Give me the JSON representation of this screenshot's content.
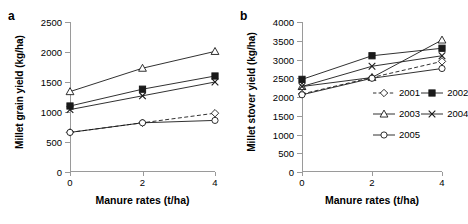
{
  "figure": {
    "panels": [
      {
        "letter": "a",
        "ylabel": "Millet grain yield (kg/ha)",
        "xlabel": "Manure rates (t/ha)"
      },
      {
        "letter": "b",
        "ylabel": "Millet stover yield (kg/ha)",
        "xlabel": "Manure rates (t/ha)"
      }
    ]
  },
  "legend": {
    "position": "inside-right-middle",
    "entries": [
      {
        "label": "2001",
        "marker": "diamond-open",
        "line": "dashed"
      },
      {
        "label": "2002",
        "marker": "square-filled",
        "line": "solid"
      },
      {
        "label": "2003",
        "marker": "triangle-open",
        "line": "solid"
      },
      {
        "label": "2004",
        "marker": "cross",
        "line": "solid"
      },
      {
        "label": "2005",
        "marker": "circle-open",
        "line": "solid"
      }
    ]
  },
  "chart_data": [
    {
      "type": "line",
      "panel": "a",
      "title": "",
      "xlabel": "Manure rates (t/ha)",
      "ylabel": "Millet grain yield (kg/ha)",
      "x": [
        0,
        2,
        4
      ],
      "xtick_labels": [
        "0",
        "2",
        "4"
      ],
      "xlim": [
        0,
        4
      ],
      "ylim": [
        0,
        2500
      ],
      "ytick_labels": [
        "0",
        "500",
        "1000",
        "1500",
        "2000",
        "2500"
      ],
      "yticks": [
        0,
        500,
        1000,
        1500,
        2000,
        2500
      ],
      "grid": false,
      "series": [
        {
          "name": "2001",
          "marker": "diamond-open",
          "line": "dashed",
          "values": [
            660,
            820,
            980
          ]
        },
        {
          "name": "2002",
          "marker": "square-filled",
          "line": "solid",
          "values": [
            1100,
            1380,
            1600
          ]
        },
        {
          "name": "2003",
          "marker": "triangle-open",
          "line": "solid",
          "values": [
            1340,
            1730,
            2010
          ]
        },
        {
          "name": "2004",
          "marker": "cross",
          "line": "solid",
          "values": [
            1040,
            1270,
            1500
          ]
        },
        {
          "name": "2005",
          "marker": "circle-open",
          "line": "solid",
          "values": [
            660,
            820,
            860
          ]
        }
      ]
    },
    {
      "type": "line",
      "panel": "b",
      "title": "",
      "xlabel": "Manure rates (t/ha)",
      "ylabel": "Millet stover yield (kg/ha)",
      "x": [
        0,
        2,
        4
      ],
      "xtick_labels": [
        "0",
        "2",
        "4"
      ],
      "xlim": [
        0,
        4
      ],
      "ylim": [
        0,
        4000
      ],
      "ytick_labels": [
        "0",
        "500",
        "1000",
        "1500",
        "2000",
        "2500",
        "3000",
        "3500",
        "4000"
      ],
      "yticks": [
        0,
        500,
        1000,
        1500,
        2000,
        2500,
        3000,
        3500,
        4000
      ],
      "grid": false,
      "series": [
        {
          "name": "2001",
          "marker": "diamond-open",
          "line": "dashed",
          "values": [
            2080,
            2520,
            2950
          ]
        },
        {
          "name": "2002",
          "marker": "square-filled",
          "line": "solid",
          "values": [
            2470,
            3100,
            3300
          ]
        },
        {
          "name": "2003",
          "marker": "triangle-open",
          "line": "solid",
          "values": [
            2280,
            2520,
            3520
          ]
        },
        {
          "name": "2004",
          "marker": "cross",
          "line": "solid",
          "values": [
            2280,
            2820,
            3100
          ]
        },
        {
          "name": "2005",
          "marker": "circle-open",
          "line": "solid",
          "values": [
            2060,
            2500,
            2760
          ]
        }
      ]
    }
  ],
  "colors": {
    "line": "#1a1a1a",
    "axis": "#9a9a9a",
    "text": "#000000",
    "background": "#ffffff"
  }
}
